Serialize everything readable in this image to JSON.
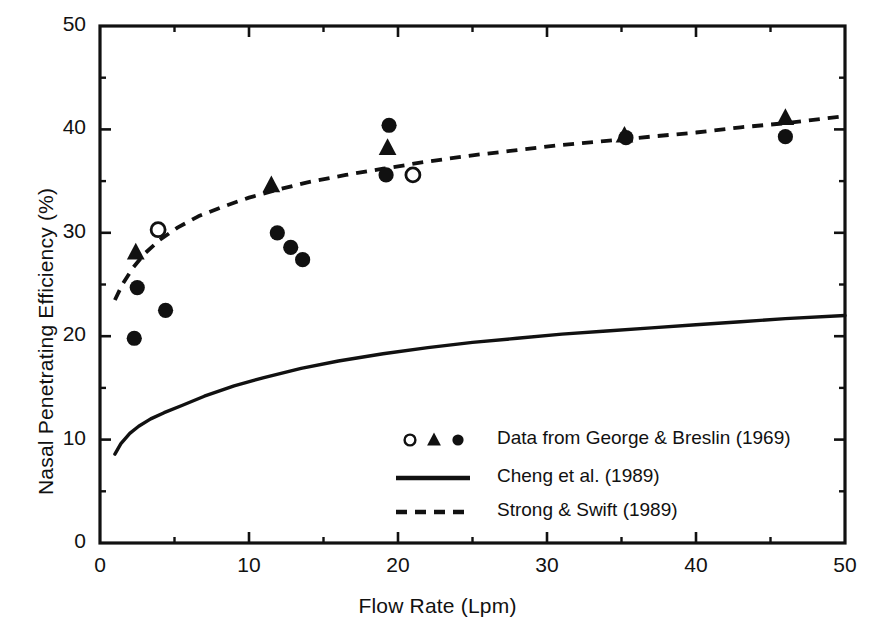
{
  "chart_data": {
    "type": "scatter",
    "title": "",
    "xlabel": "Flow Rate (Lpm)",
    "ylabel": "Nasal Penetrating Efficiency (%)",
    "xlim": [
      0,
      50
    ],
    "ylim": [
      0,
      50
    ],
    "xticks": [
      0,
      10,
      20,
      30,
      40,
      50
    ],
    "yticks": [
      0,
      10,
      20,
      30,
      40,
      50
    ],
    "xticks_minor": [
      5,
      15,
      25,
      35,
      45
    ],
    "yticks_minor": [
      5,
      15,
      25,
      35,
      45
    ],
    "grid": false,
    "legend_position": "inside lower-right",
    "series": [
      {
        "name": "Data from George & Breslin (1969)",
        "marker": "mixed-open-circle-triangle-filled-circle",
        "points_open_circle": [
          {
            "x": 3.9,
            "y": 30.3
          },
          {
            "x": 21.0,
            "y": 35.6
          }
        ],
        "points_triangle": [
          {
            "x": 2.4,
            "y": 28.1
          },
          {
            "x": 11.5,
            "y": 34.6
          },
          {
            "x": 19.3,
            "y": 38.2
          },
          {
            "x": 35.2,
            "y": 39.4
          },
          {
            "x": 46.0,
            "y": 41.1
          }
        ],
        "points_filled_circle": [
          {
            "x": 2.5,
            "y": 24.7
          },
          {
            "x": 4.4,
            "y": 22.5
          },
          {
            "x": 2.3,
            "y": 19.8
          },
          {
            "x": 11.9,
            "y": 30.0
          },
          {
            "x": 12.8,
            "y": 28.6
          },
          {
            "x": 13.6,
            "y": 27.4
          },
          {
            "x": 19.4,
            "y": 40.4
          },
          {
            "x": 19.2,
            "y": 35.6
          },
          {
            "x": 35.3,
            "y": 39.2
          },
          {
            "x": 46.0,
            "y": 39.3
          }
        ]
      },
      {
        "name": "Cheng et al. (1989)",
        "style": "solid-line",
        "x": [
          1.0,
          1.4,
          2.0,
          2.6,
          3.4,
          4.3,
          5.5,
          7.0,
          9.0,
          11.0,
          13.5,
          16.0,
          19.0,
          22.0,
          25.0,
          28.0,
          31.0,
          34.0,
          37.0,
          40.0,
          43.0,
          46.0,
          50.0
        ],
        "y": [
          8.6,
          9.6,
          10.6,
          11.3,
          12.0,
          12.6,
          13.3,
          14.2,
          15.2,
          16.0,
          16.9,
          17.6,
          18.3,
          18.9,
          19.4,
          19.8,
          20.2,
          20.5,
          20.8,
          21.1,
          21.4,
          21.7,
          22.0
        ]
      },
      {
        "name": "Strong & Swift (1989)",
        "style": "dashed-line",
        "x": [
          1.0,
          1.5,
          2.2,
          3.0,
          4.0,
          5.2,
          6.6,
          8.2,
          10.0,
          12.0,
          14.0,
          16.5,
          19.0,
          22.0,
          25.0,
          28.0,
          31.0,
          34.0,
          37.0,
          40.0,
          43.0,
          46.0,
          50.0
        ],
        "y": [
          23.5,
          25.0,
          26.6,
          28.0,
          29.3,
          30.5,
          31.6,
          32.5,
          33.4,
          34.2,
          34.9,
          35.6,
          36.2,
          36.9,
          37.5,
          38.0,
          38.5,
          38.9,
          39.3,
          39.7,
          40.2,
          40.6,
          41.3
        ]
      }
    ],
    "legend_entries": [
      {
        "label": "Data from George & Breslin (1969)",
        "marker": "markers"
      },
      {
        "label": "Cheng et al. (1989)",
        "marker": "solid"
      },
      {
        "label": "Strong & Swift (1989)",
        "marker": "dashed"
      }
    ]
  },
  "colors": {
    "foreground": "#111111",
    "background": "#ffffff"
  }
}
